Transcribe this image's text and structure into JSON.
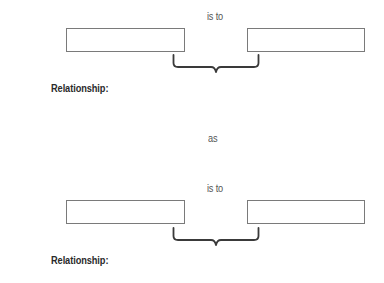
{
  "analogy": {
    "first_pair": {
      "connector": "is to",
      "left_box_value": "",
      "right_box_value": "",
      "relationship_label": "Relationship:"
    },
    "separator": "as",
    "second_pair": {
      "connector": "is to",
      "left_box_value": "",
      "right_box_value": "",
      "relationship_label": "Relationship:"
    }
  },
  "icons": {
    "brace": "curly-brace-icon"
  }
}
